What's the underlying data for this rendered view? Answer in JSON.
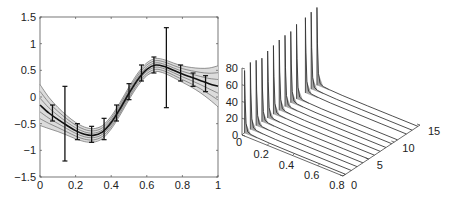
{
  "chart_data": [
    {
      "type": "line",
      "title": "",
      "xlabel": "",
      "ylabel": "",
      "xlim": [
        0,
        1
      ],
      "ylim": [
        -1.5,
        1.5
      ],
      "grid": false,
      "legend": null,
      "x_ticks": [
        "0",
        "0.2",
        "0.4",
        "0.6",
        "0.8",
        "1"
      ],
      "y_ticks": [
        "1.5",
        "1",
        "0.5",
        "0",
        "−0.5",
        "−1",
        "−1.5"
      ],
      "series": [
        {
          "name": "mean fit",
          "x": [
            0,
            0.05,
            0.1,
            0.15,
            0.2,
            0.25,
            0.3,
            0.35,
            0.4,
            0.45,
            0.5,
            0.55,
            0.6,
            0.65,
            0.7,
            0.75,
            0.8,
            0.85,
            0.9,
            0.95,
            1.0
          ],
          "values": [
            -0.15,
            -0.3,
            -0.42,
            -0.53,
            -0.63,
            -0.7,
            -0.72,
            -0.66,
            -0.48,
            -0.22,
            0.07,
            0.33,
            0.52,
            0.6,
            0.57,
            0.5,
            0.43,
            0.37,
            0.31,
            0.25,
            0.2
          ]
        }
      ],
      "band_offsets": [
        -0.12,
        -0.08,
        -0.04,
        0.04,
        0.08,
        0.12
      ],
      "error_bars": [
        {
          "x": 0.07,
          "y": -0.3,
          "low": -0.45,
          "high": -0.15
        },
        {
          "x": 0.14,
          "y": -0.5,
          "low": -1.2,
          "high": 0.2
        },
        {
          "x": 0.21,
          "y": -0.65,
          "low": -0.8,
          "high": -0.5
        },
        {
          "x": 0.29,
          "y": -0.7,
          "low": -0.85,
          "high": -0.55
        },
        {
          "x": 0.36,
          "y": -0.6,
          "low": -0.8,
          "high": -0.4
        },
        {
          "x": 0.43,
          "y": -0.3,
          "low": -0.45,
          "high": -0.15
        },
        {
          "x": 0.5,
          "y": 0.1,
          "low": -0.05,
          "high": 0.25
        },
        {
          "x": 0.57,
          "y": 0.45,
          "low": 0.3,
          "high": 0.6
        },
        {
          "x": 0.64,
          "y": 0.6,
          "low": 0.45,
          "high": 0.75
        },
        {
          "x": 0.71,
          "y": 0.55,
          "low": -0.2,
          "high": 1.3
        },
        {
          "x": 0.79,
          "y": 0.45,
          "low": 0.3,
          "high": 0.6
        },
        {
          "x": 0.86,
          "y": 0.33,
          "low": 0.2,
          "high": 0.45
        },
        {
          "x": 0.93,
          "y": 0.25,
          "low": 0.1,
          "high": 0.4
        }
      ]
    },
    {
      "type": "area",
      "subtype": "3d-waterfall",
      "title": "",
      "xlabel": "",
      "ylabel": "",
      "zlabel": "",
      "xlim": [
        0,
        0.8
      ],
      "ylim": [
        0,
        15
      ],
      "zlim": [
        0,
        80
      ],
      "x_ticks": [
        "0",
        "0.2",
        "0.4",
        "0.6",
        "0.8"
      ],
      "y_ticks": [
        "0",
        "5",
        "10",
        "15"
      ],
      "z_ticks": [
        "0",
        "20",
        "40",
        "60",
        "80"
      ],
      "grid": false,
      "series_count": 13,
      "peak_heights": [
        75,
        80,
        78,
        76,
        80,
        82,
        84,
        85,
        85,
        89,
        90,
        92,
        93
      ],
      "peak_x": 0.0
    }
  ],
  "colors": {
    "axis": "#333333",
    "line": "#111111",
    "band": "#777777",
    "band_fill": "#d9d9d9",
    "spike_fill": "#9a9a9a"
  }
}
